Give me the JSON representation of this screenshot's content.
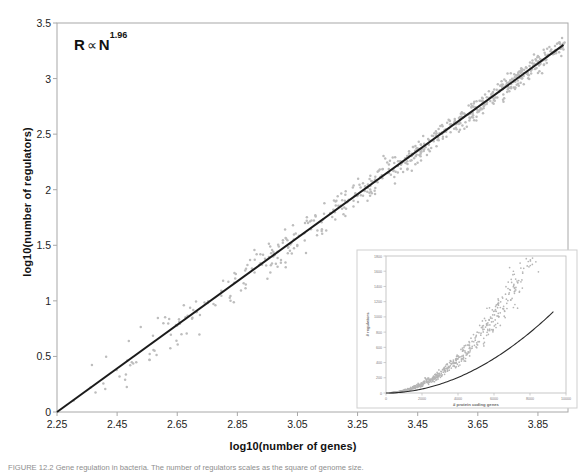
{
  "figure": {
    "annotation": {
      "base": "R",
      "proportional": "∝",
      "variable": "N",
      "exponent": "1.96"
    },
    "caption": "FIGURE 12.2  Gene regulation in bacteria. The number of regulators scales as the square of genome size."
  },
  "main_axes": {
    "xlabel": "log10(number of genes)",
    "ylabel": "log10(number of regulators)",
    "xticks": [
      "2.25",
      "2.45",
      "2.65",
      "2.85",
      "3.05",
      "3.25",
      "3.45",
      "3.65",
      "3.85"
    ],
    "yticks": [
      "0",
      "0.5",
      "1",
      "1.5",
      "2",
      "2.5",
      "3",
      "3.5"
    ]
  },
  "inset_axes": {
    "xlabel": "# protein coding genes",
    "ylabel": "# regulators",
    "xticks": [
      "0",
      "2000",
      "4000",
      "6000",
      "8000",
      "10000"
    ],
    "yticks": [
      "0",
      "200",
      "400",
      "600",
      "800",
      "1000",
      "1200",
      "1400",
      "1600",
      "1800"
    ]
  },
  "colors": {
    "point": "#bdbdbd",
    "line": "#1b1b1b",
    "frame": "#a8a8a8",
    "inset_frame": "#cfcfcf",
    "text": "#1a1a1a"
  },
  "chart_data": {
    "type": "scatter",
    "title": "",
    "xlabel": "log10(number of genes)",
    "ylabel": "log10(number of regulators)",
    "xlim": [
      2.25,
      3.95
    ],
    "ylim": [
      0,
      3.5
    ],
    "grid": false,
    "legend": null,
    "annotations": [
      {
        "text": "R ∝ N^1.96",
        "x": 2.34,
        "y": 3.22
      }
    ],
    "series": [
      {
        "name": "genomes",
        "type": "scatter",
        "marker_color": "#bdbdbd",
        "n_points": 620,
        "x_range": [
          2.28,
          3.94
        ],
        "x_density_exponent": 2.1,
        "scatter_sigma": 0.135,
        "sigma_taper": 0.55,
        "comment": "point cloud follows the fit line with vertical spread; density increases with x"
      },
      {
        "name": "fit",
        "type": "line",
        "color": "#1b1b1b",
        "equation": "y = 1.96 * (x - 2.25)",
        "slope": 1.96,
        "x_intercept": 2.25,
        "endpoints": [
          [
            2.25,
            0.0
          ],
          [
            3.935,
            3.303
          ]
        ]
      }
    ],
    "inset": {
      "type": "scatter",
      "xlabel": "# protein coding genes",
      "ylabel": "# regulators",
      "xlim": [
        0,
        10000
      ],
      "ylim": [
        0,
        1800
      ],
      "xticks": [
        0,
        2000,
        4000,
        6000,
        8000,
        10000
      ],
      "yticks": [
        0,
        200,
        400,
        600,
        800,
        1000,
        1200,
        1400,
        1600,
        1800
      ],
      "grid": false,
      "series": [
        {
          "name": "genomes",
          "type": "scatter",
          "marker_color": "#b5b5b5",
          "n_points": 620,
          "comment": "same data on linear axes, curving upward"
        },
        {
          "name": "fit",
          "type": "line",
          "color": "#2a2a2a",
          "equation": "R = 1.78e-5 * N^1.96",
          "coefficient": 1.78e-05,
          "exponent": 1.96
        }
      ]
    }
  }
}
